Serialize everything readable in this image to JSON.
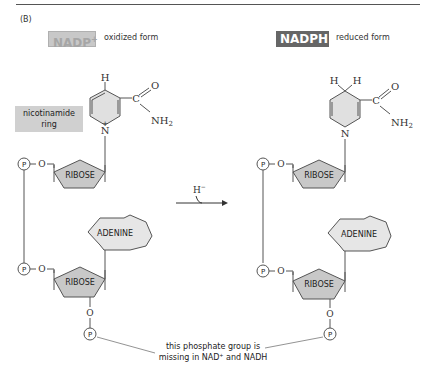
{
  "panel": {
    "label": "(B)"
  },
  "left": {
    "badge": "NADP",
    "badge_sup": "+",
    "form": "oxidized form",
    "ring_label_line1": "nicotinamide",
    "ring_label_line2": "ring",
    "atoms": {
      "h_top": "H",
      "o": "O",
      "c": "C",
      "nh2": "NH",
      "nh2_sub": "2",
      "n": "N",
      "plus": "+"
    },
    "ribose_top": "RIBOSE",
    "adenine": "ADENINE",
    "ribose_bottom": "RIBOSE",
    "phosphate": "P",
    "oxygen": "O"
  },
  "right": {
    "badge": "NADPH",
    "form": "reduced form",
    "atoms": {
      "h1": "H",
      "h2": "H",
      "o": "O",
      "c": "C",
      "nh2": "NH",
      "nh2_sub": "2",
      "n": "N"
    },
    "ribose_top": "RIBOSE",
    "adenine": "ADENINE",
    "ribose_bottom": "RIBOSE",
    "phosphate": "P",
    "oxygen": "O"
  },
  "reaction": {
    "hydride": "H",
    "hydride_sup": "−"
  },
  "annotation": {
    "line1": "this phosphate group is",
    "line2_a": "missing in NAD",
    "line2_sup": "+",
    "line2_b": " and NADH"
  },
  "colors": {
    "shape_fill": "#c8c8c8",
    "adenine_fill": "#e6e6e6",
    "ring_fill": "#e0e0e0",
    "label_box": "#d0d0d0",
    "line": "#555555"
  }
}
